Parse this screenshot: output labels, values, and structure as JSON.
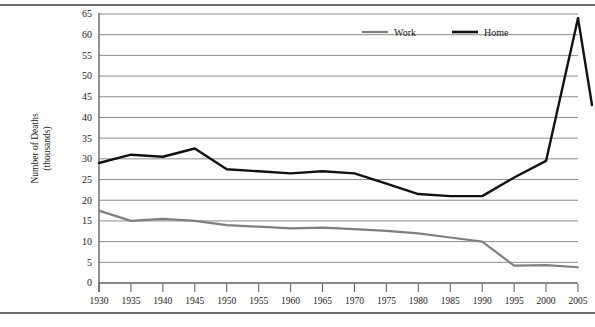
{
  "figure": {
    "has_top_rule": true,
    "has_bottom_rule": true
  },
  "chart_data": {
    "type": "line",
    "title": "",
    "subtitle": "",
    "xlabel": "Year",
    "ylabel": "Number of Deaths (thousands)",
    "ylabel_line1": "Number of Deaths",
    "ylabel_line2": "(thousands)",
    "grid": true,
    "legend_position": "top-right",
    "xlim": [
      1930,
      2005
    ],
    "ylim": [
      0,
      65
    ],
    "ytick_step": 5,
    "x": [
      1930,
      1935,
      1940,
      1945,
      1950,
      1955,
      1960,
      1965,
      1970,
      1975,
      1980,
      1985,
      1990,
      1995,
      2000,
      2005
    ],
    "xtick_labels": [
      "1930",
      "1935",
      "1940",
      "1945",
      "1950",
      "1955",
      "1960",
      "1965",
      "1970",
      "1975",
      "1980",
      "1985",
      "1990",
      "1995",
      "2000",
      "2005"
    ],
    "ytick_labels": [
      "0",
      "5",
      "10",
      "15",
      "20",
      "25",
      "30",
      "35",
      "40",
      "45",
      "50",
      "55",
      "60",
      "65"
    ],
    "ytick_values": [
      0,
      5,
      10,
      15,
      20,
      25,
      30,
      35,
      40,
      45,
      50,
      55,
      60,
      65
    ],
    "series": [
      {
        "name": "Work",
        "color": "#808080",
        "width": 2.2,
        "values": [
          17.5,
          15.0,
          15.5,
          15.0,
          14.0,
          13.6,
          13.2,
          13.4,
          13.0,
          12.6,
          12.0,
          11.0,
          10.0,
          4.2,
          4.3,
          3.8
        ]
      },
      {
        "name": "Home",
        "color": "#121212",
        "width": 2.4,
        "values": [
          29.0,
          31.0,
          30.5,
          32.5,
          27.5,
          27.0,
          26.5,
          27.0,
          26.5,
          24.0,
          21.5,
          21.0,
          21.0,
          25.5,
          29.5,
          64.0
        ]
      }
    ],
    "annotations": [
      {
        "label": "terminal descent after 2005 peak",
        "series": "Home",
        "from_value": 64.0,
        "to_value": 43.0
      }
    ],
    "home_tail_value": 43.0
  },
  "legend": {
    "items": [
      {
        "label": "Work",
        "color": "#808080"
      },
      {
        "label": "Home",
        "color": "#121212"
      }
    ]
  }
}
